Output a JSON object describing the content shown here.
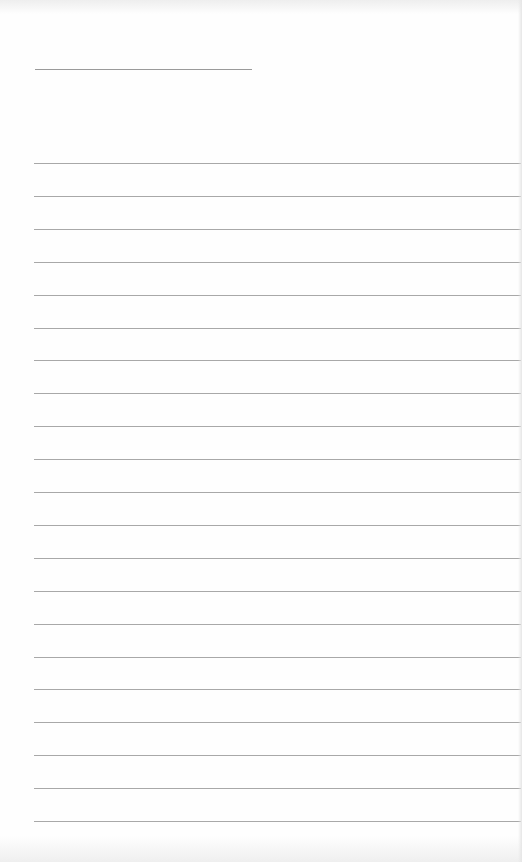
{
  "document": {
    "type": "blank lined page",
    "title_line": {
      "label": "",
      "x": 35,
      "y": 69,
      "width": 217
    },
    "ruled_lines": {
      "count": 21,
      "start_y": 163,
      "spacing": 32.9,
      "x": 34,
      "width": 487,
      "color": "#a8a8a8"
    },
    "entries": [
      "",
      "",
      "",
      "",
      "",
      "",
      "",
      "",
      "",
      "",
      "",
      "",
      "",
      "",
      "",
      "",
      "",
      "",
      "",
      "",
      ""
    ]
  }
}
